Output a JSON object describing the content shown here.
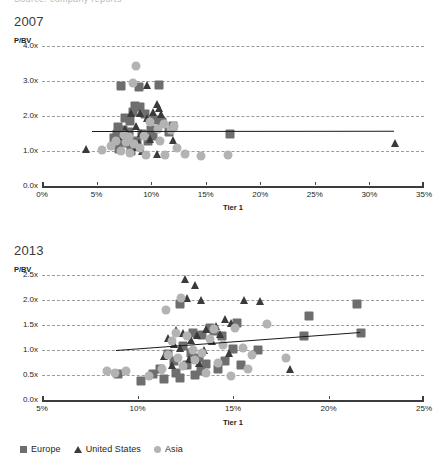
{
  "clipped_header": "Source: company reports",
  "colors": {
    "europe": "#6e6e6e",
    "united_states": "#3a3a3a",
    "asia": "#b3b3b3",
    "trendline": "#1a1a1a",
    "gridline": "#9b9b9b",
    "axis": "#3c3c3c",
    "text": "#231f20"
  },
  "legend": {
    "position": "bottom-left",
    "items": [
      {
        "label": "Europe",
        "shape": "square",
        "color": "#6e6e6e",
        "icon": "square-marker-icon"
      },
      {
        "label": "United States",
        "shape": "triangle",
        "color": "#3a3a3a",
        "icon": "triangle-marker-icon"
      },
      {
        "label": "Asia",
        "shape": "circle",
        "color": "#b3b3b3",
        "icon": "circle-marker-icon"
      }
    ]
  },
  "chart_data": [
    {
      "id": "chart-2007",
      "type": "scatter",
      "title": "2007",
      "xlabel": "Tier 1",
      "ylabel": "P/BV",
      "grid": true,
      "xlim": [
        0,
        35
      ],
      "ylim": [
        0,
        4
      ],
      "xticks": [
        "0%",
        "5%",
        "10%",
        "15%",
        "20%",
        "25%",
        "30%",
        "35%"
      ],
      "xtick_values": [
        0,
        5,
        10,
        15,
        20,
        25,
        30,
        35
      ],
      "yticks": [
        "0.0x",
        "1.0x",
        "2.0x",
        "3.0x",
        "4.0x"
      ],
      "ytick_values": [
        0,
        1,
        2,
        3,
        4
      ],
      "trendline": {
        "x0": 4.6,
        "y0": 1.56,
        "x1": 32.3,
        "y1": 1.57
      },
      "series": [
        {
          "name": "Europe",
          "shape": "square",
          "color": "#6e6e6e",
          "points": [
            [
              7.2,
              2.85
            ],
            [
              10.7,
              2.9
            ],
            [
              8.9,
              2.82
            ],
            [
              8.5,
              2.3
            ],
            [
              9.0,
              2.25
            ],
            [
              8.3,
              2.12
            ],
            [
              9.4,
              2.05
            ],
            [
              7.6,
              1.93
            ],
            [
              8.1,
              1.86
            ],
            [
              10.3,
              1.88
            ],
            [
              11.0,
              1.82
            ],
            [
              12.0,
              1.72
            ],
            [
              7.0,
              1.68
            ],
            [
              7.4,
              1.6
            ],
            [
              8.0,
              1.55
            ],
            [
              6.9,
              1.5
            ],
            [
              7.8,
              1.45
            ],
            [
              9.2,
              1.5
            ],
            [
              10.0,
              1.6
            ],
            [
              11.6,
              1.55
            ],
            [
              17.2,
              1.5
            ],
            [
              7.3,
              1.3
            ],
            [
              8.7,
              1.28
            ],
            [
              7.9,
              1.22
            ],
            [
              8.6,
              1.15
            ],
            [
              9.7,
              1.3
            ],
            [
              6.6,
              1.38
            ],
            [
              10.2,
              1.42
            ],
            [
              7.1,
              1.05
            ],
            [
              8.2,
              1.0
            ]
          ]
        },
        {
          "name": "United States",
          "shape": "triangle",
          "color": "#3a3a3a",
          "points": [
            [
              9.6,
              2.88
            ],
            [
              10.5,
              2.35
            ],
            [
              10.7,
              2.22
            ],
            [
              10.2,
              2.12
            ],
            [
              10.9,
              2.05
            ],
            [
              9.0,
              2.1
            ],
            [
              8.2,
              2.08
            ],
            [
              9.6,
              1.95
            ],
            [
              8.6,
              1.72
            ],
            [
              7.6,
              1.62
            ],
            [
              9.1,
              1.52
            ],
            [
              9.9,
              1.35
            ],
            [
              12.0,
              1.32
            ],
            [
              4.0,
              1.05
            ],
            [
              8.6,
              1.12
            ],
            [
              9.2,
              1.0
            ],
            [
              10.5,
              0.92
            ],
            [
              32.3,
              1.22
            ],
            [
              8.9,
              1.22
            ],
            [
              7.4,
              1.42
            ]
          ]
        },
        {
          "name": "Asia",
          "shape": "circle",
          "color": "#b3b3b3",
          "points": [
            [
              8.6,
              3.42
            ],
            [
              8.3,
              2.95
            ],
            [
              9.9,
              1.82
            ],
            [
              11.2,
              1.78
            ],
            [
              12.1,
              1.72
            ],
            [
              10.6,
              1.62
            ],
            [
              11.8,
              1.6
            ],
            [
              7.5,
              1.45
            ],
            [
              8.0,
              1.4
            ],
            [
              9.3,
              1.42
            ],
            [
              6.8,
              1.3
            ],
            [
              7.7,
              1.25
            ],
            [
              8.4,
              1.2
            ],
            [
              10.8,
              1.28
            ],
            [
              12.4,
              1.1
            ],
            [
              9.0,
              1.08
            ],
            [
              7.2,
              1.0
            ],
            [
              8.1,
              0.95
            ],
            [
              5.5,
              1.03
            ],
            [
              13.1,
              0.92
            ],
            [
              11.3,
              0.88
            ],
            [
              14.6,
              0.86
            ],
            [
              17.0,
              0.88
            ],
            [
              9.5,
              0.9
            ],
            [
              6.3,
              1.15
            ]
          ]
        }
      ]
    },
    {
      "id": "chart-2013",
      "type": "scatter",
      "title": "2013",
      "xlabel": "Tier 1",
      "ylabel": "P/BV",
      "grid": true,
      "xlim": [
        5,
        25
      ],
      "ylim": [
        0,
        2.5
      ],
      "xticks": [
        "5%",
        "10%",
        "15%",
        "20%",
        "25%"
      ],
      "xtick_values": [
        5,
        10,
        15,
        20,
        25
      ],
      "yticks": [
        "0.0x",
        "0.5x",
        "1.0x",
        "1.5x",
        "2.0x",
        "2.5x"
      ],
      "ytick_values": [
        0,
        0.5,
        1,
        1.5,
        2,
        2.5
      ],
      "trendline": {
        "x0": 8.9,
        "y0": 1.0,
        "x1": 21.7,
        "y1": 1.36
      },
      "series": [
        {
          "name": "Europe",
          "shape": "square",
          "color": "#6e6e6e",
          "points": [
            [
              12.2,
              1.93
            ],
            [
              21.5,
              1.92
            ],
            [
              19.0,
              1.68
            ],
            [
              15.2,
              1.55
            ],
            [
              13.8,
              1.45
            ],
            [
              14.0,
              1.38
            ],
            [
              13.4,
              1.3
            ],
            [
              12.9,
              1.35
            ],
            [
              14.4,
              1.28
            ],
            [
              18.7,
              1.28
            ],
            [
              21.7,
              1.35
            ],
            [
              15.0,
              1.02
            ],
            [
              16.3,
              1.0
            ],
            [
              12.4,
              1.08
            ],
            [
              12.8,
              0.95
            ],
            [
              13.2,
              0.85
            ],
            [
              11.6,
              0.92
            ],
            [
              11.9,
              0.78
            ],
            [
              12.6,
              0.7
            ],
            [
              13.6,
              0.72
            ],
            [
              14.2,
              0.62
            ],
            [
              11.2,
              0.62
            ],
            [
              12.0,
              0.55
            ],
            [
              13.0,
              0.5
            ],
            [
              10.8,
              0.52
            ],
            [
              9.0,
              0.52
            ],
            [
              10.2,
              0.38
            ],
            [
              11.4,
              0.42
            ],
            [
              12.2,
              0.45
            ],
            [
              13.3,
              0.58
            ],
            [
              14.6,
              0.78
            ],
            [
              15.4,
              0.7
            ]
          ]
        },
        {
          "name": "United States",
          "shape": "triangle",
          "color": "#3a3a3a",
          "points": [
            [
              12.5,
              2.42
            ],
            [
              13.0,
              2.3
            ],
            [
              12.6,
              2.05
            ],
            [
              13.3,
              2.0
            ],
            [
              15.6,
              2.0
            ],
            [
              16.4,
              1.98
            ],
            [
              14.6,
              1.62
            ],
            [
              14.9,
              1.55
            ],
            [
              14.1,
              1.48
            ],
            [
              13.6,
              1.42
            ],
            [
              12.0,
              1.4
            ],
            [
              12.4,
              1.35
            ],
            [
              13.1,
              1.3
            ],
            [
              14.3,
              1.32
            ],
            [
              11.6,
              1.25
            ],
            [
              12.8,
              1.2
            ],
            [
              13.9,
              1.18
            ],
            [
              11.9,
              1.12
            ],
            [
              12.2,
              1.05
            ],
            [
              13.5,
              1.0
            ],
            [
              14.8,
              0.95
            ],
            [
              11.4,
              0.88
            ],
            [
              12.7,
              0.82
            ],
            [
              13.2,
              0.75
            ],
            [
              11.8,
              0.7
            ],
            [
              18.0,
              0.62
            ]
          ]
        },
        {
          "name": "Asia",
          "shape": "circle",
          "color": "#b3b3b3",
          "points": [
            [
              12.3,
              2.05
            ],
            [
              11.5,
              1.8
            ],
            [
              16.8,
              1.52
            ],
            [
              15.1,
              1.45
            ],
            [
              14.0,
              1.42
            ],
            [
              12.0,
              1.35
            ],
            [
              12.6,
              1.28
            ],
            [
              13.8,
              1.22
            ],
            [
              11.8,
              1.18
            ],
            [
              14.5,
              1.1
            ],
            [
              15.5,
              1.05
            ],
            [
              12.9,
              1.0
            ],
            [
              13.4,
              0.95
            ],
            [
              11.6,
              0.9
            ],
            [
              12.1,
              0.85
            ],
            [
              13.0,
              0.8
            ],
            [
              14.2,
              0.75
            ],
            [
              16.0,
              0.9
            ],
            [
              12.4,
              0.68
            ],
            [
              11.3,
              0.62
            ],
            [
              8.4,
              0.58
            ],
            [
              8.8,
              0.55
            ],
            [
              9.4,
              0.58
            ],
            [
              13.6,
              0.55
            ],
            [
              10.6,
              0.48
            ],
            [
              14.9,
              0.48
            ],
            [
              17.8,
              0.85
            ],
            [
              15.8,
              0.62
            ]
          ]
        }
      ]
    }
  ]
}
